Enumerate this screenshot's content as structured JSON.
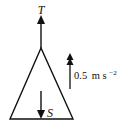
{
  "diagram": {
    "type": "force-diagram",
    "object_shape": "triangle",
    "forces": [
      {
        "label": "T",
        "direction": "up"
      },
      {
        "label": "S",
        "direction": "down"
      }
    ],
    "acceleration": {
      "value": "0.5",
      "unit": "m s",
      "exponent": "−2",
      "direction": "up",
      "arrow_style": "double-head"
    },
    "colors": {
      "stroke": "#111111",
      "background": "#ffffff"
    }
  }
}
